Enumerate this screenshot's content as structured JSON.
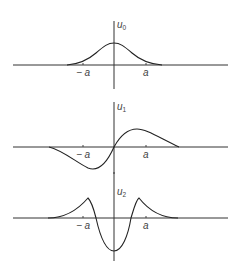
{
  "figure": {
    "panels": [
      {
        "id": "u0",
        "axis_label": "u",
        "subscript": "0",
        "ticks": {
          "neg": "− a",
          "pos": "a"
        },
        "shape": "bell (even, one hump)"
      },
      {
        "id": "u1",
        "axis_label": "u",
        "subscript": "1",
        "ticks": {
          "neg": "− a",
          "pos": "a"
        },
        "shape": "odd (trough left, crest right)"
      },
      {
        "id": "u2",
        "axis_label": "u",
        "subscript": "2",
        "ticks": {
          "neg": "− a",
          "pos": "a"
        },
        "shape": "even (two side peaks, central trough)"
      }
    ],
    "colors": {
      "line": "#222222",
      "background": "#ffffff"
    }
  }
}
